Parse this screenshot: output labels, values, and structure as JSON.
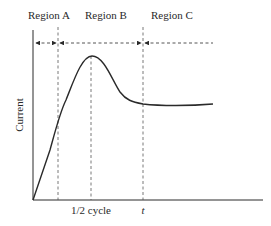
{
  "diagram": {
    "regions": [
      {
        "label": "Region A"
      },
      {
        "label": "Region B"
      },
      {
        "label": "Region C"
      }
    ],
    "y_axis_label": "Current",
    "x_ticks": [
      {
        "label": "1/2 cycle"
      },
      {
        "label": "t"
      }
    ],
    "colors": {
      "line": "#2a2a2a",
      "dash": "#555555",
      "background": "#ffffff"
    }
  }
}
